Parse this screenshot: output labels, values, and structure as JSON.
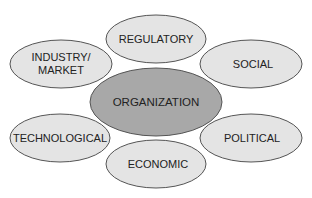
{
  "diagram": {
    "center": {
      "label": "ORGANIZATION",
      "cx": 156,
      "cy": 102,
      "rx": 66,
      "ry": 34,
      "fill": "#a8a8a8"
    },
    "nodes": [
      {
        "id": "regulatory",
        "label": "REGULATORY",
        "lines": [
          "REGULATORY"
        ],
        "cx": 156,
        "cy": 39,
        "rx": 50,
        "ry": 24
      },
      {
        "id": "industry-market",
        "label": "INDUSTRY/ MARKET",
        "lines": [
          "INDUSTRY/",
          "MARKET"
        ],
        "cx": 61,
        "cy": 64,
        "rx": 51,
        "ry": 24
      },
      {
        "id": "social",
        "label": "SOCIAL",
        "lines": [
          "SOCIAL"
        ],
        "cx": 251,
        "cy": 64,
        "rx": 51,
        "ry": 24
      },
      {
        "id": "technological",
        "label": "TECHNOLOGICAL",
        "lines": [
          "TECHNOLOGICAL"
        ],
        "cx": 60,
        "cy": 138,
        "rx": 50,
        "ry": 24
      },
      {
        "id": "political",
        "label": "POLITICAL",
        "lines": [
          "POLITICAL"
        ],
        "cx": 251,
        "cy": 138,
        "rx": 51,
        "ry": 24
      },
      {
        "id": "economic",
        "label": "ECONOMIC",
        "lines": [
          "ECONOMIC"
        ],
        "cx": 156,
        "cy": 164,
        "rx": 50,
        "ry": 24
      }
    ],
    "colors": {
      "node_fill": "#e4e4e4",
      "stroke": "#555555",
      "text": "#222222"
    }
  }
}
